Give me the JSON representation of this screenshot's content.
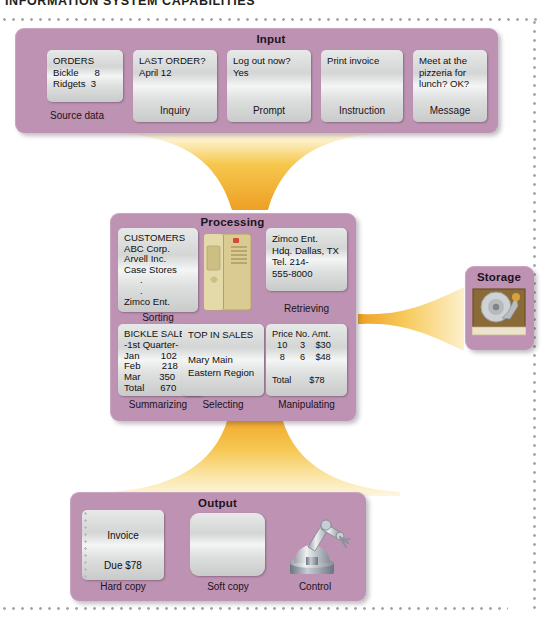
{
  "document": {
    "title": "INFORMATION SYSTEM CAPABILITIES"
  },
  "colors": {
    "panel_purple": "#bd92b2",
    "tile_silver": "#dcdfde",
    "flow_orange": "#f0a62a",
    "page_background": "#ffffff",
    "dot_border": "#a8a8a8",
    "text_dark": "#1c1320"
  },
  "sections": {
    "input": {
      "title": "Input",
      "tiles": [
        {
          "caption": "Source data",
          "lines": "ORDERS\nBickle      8\nRidgets  3"
        },
        {
          "caption": "Inquiry",
          "lines": "LAST ORDER?\nApril 12"
        },
        {
          "caption": "Prompt",
          "lines": "Log out now?\nYes"
        },
        {
          "caption": "Instruction",
          "lines": "Print invoice"
        },
        {
          "caption": "Message",
          "lines": "Meet at the\npizzeria for\nlunch? OK?"
        }
      ]
    },
    "processing": {
      "title": "Processing",
      "tiles": [
        {
          "caption": "Sorting",
          "lines": "CUSTOMERS\nABC Corp.\nArvell Inc.\nCase Stores\n      .\n      .\nZimco Ent."
        },
        {
          "caption": "Retrieving",
          "lines": "Zimco Ent.\nHdq. Dallas, TX\nTel. 214-\n555-8000"
        },
        {
          "caption": "Summarizing",
          "lines": "BICKLE SALES\n-1st Quarter-\nJan        102\nFeb        218\nMar       350\nTotal      670"
        },
        {
          "caption": "Selecting",
          "lines": "TOP IN SALES\n\nMary Main\nEastern Region"
        },
        {
          "caption": "Manipulating",
          "lines": "Price No. Amt.\n  10     3    $30\n   8      6    $48\n\nTotal       $78"
        }
      ],
      "graphic": "computer-tower-icon"
    },
    "storage": {
      "title": "Storage",
      "graphic": "hard-disk-drive-icon"
    },
    "output": {
      "title": "Output",
      "tiles": [
        {
          "caption": "Hard copy",
          "line_top": "Invoice",
          "line_bottom": "Due $78"
        },
        {
          "caption": "Soft copy",
          "line_top": "",
          "line_bottom": ""
        },
        {
          "caption": "Control",
          "graphic": "robot-arm-icon"
        }
      ]
    }
  },
  "flows": [
    {
      "name": "input-to-processing",
      "direction": "down"
    },
    {
      "name": "processing-to-output",
      "direction": "down"
    },
    {
      "name": "processing-to-storage",
      "direction": "right"
    }
  ]
}
